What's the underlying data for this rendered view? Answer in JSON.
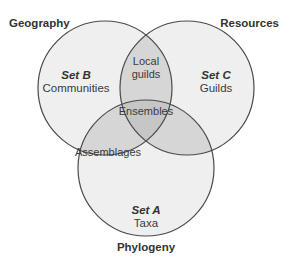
{
  "colors": {
    "single": "#efefef",
    "double": "#d6d6d6",
    "triple": "#c6c6c6",
    "stroke": "#4a4a4a"
  },
  "axes": {
    "top_left": "Geography",
    "top_right": "Resources",
    "bottom": "Phylogeny"
  },
  "sets": {
    "B": {
      "name": "Set B",
      "label": "Communities"
    },
    "C": {
      "name": "Set C",
      "label": "Guilds"
    },
    "A": {
      "name": "Set A",
      "label": "Taxa"
    }
  },
  "intersections": {
    "BC_line1": "Local",
    "BC_line2": "guilds",
    "AB": "Assemblages",
    "ABC": "Ensembles"
  }
}
